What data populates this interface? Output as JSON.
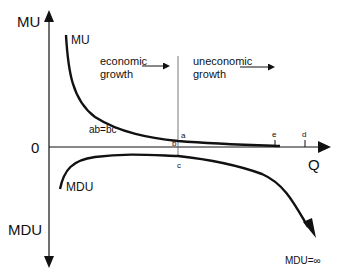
{
  "axes": {
    "y_top_label": "MU",
    "y_bottom_label": "MDU",
    "origin_label": "0",
    "x_label": "Q"
  },
  "curves": {
    "mu_label": "MU",
    "mdu_label": "MDU"
  },
  "regions": {
    "economic": {
      "line1": "economic",
      "line2": "growth"
    },
    "uneconomic": {
      "line1": "uneconomic",
      "line2": "growth"
    }
  },
  "points": {
    "a": "a",
    "b": "b",
    "c": "c",
    "d": "d",
    "e": "e"
  },
  "annotations": {
    "equality": "ab=bc",
    "mdu_infinity": "MDU=∞"
  },
  "colors": {
    "line": "#111111",
    "background": "#ffffff"
  }
}
